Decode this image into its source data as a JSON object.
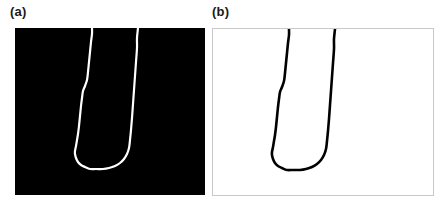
{
  "figure": {
    "caption_present": false,
    "background_color": "#ffffff",
    "width": 444,
    "height": 207
  },
  "panels": [
    {
      "id": "a",
      "label": "(a)",
      "kind": "binary-mask",
      "background_color": "#000000",
      "contour_color": "#ffffff",
      "frame_color": "none",
      "bounds": {
        "x": 15,
        "y": 28,
        "width": 190,
        "height": 167
      },
      "line_width": 2.2
    },
    {
      "id": "b",
      "label": "(b)",
      "kind": "extracted-contour",
      "background_color": "#ffffff",
      "contour_color": "#000000",
      "frame_color": "#c9c9c9",
      "bounds": {
        "x": 212,
        "y": 28,
        "width": 222,
        "height": 168
      },
      "line_width": 2.6
    }
  ],
  "chart_data": {
    "type": "line",
    "title": "",
    "subtitle": "",
    "xlabel": "",
    "ylabel": "",
    "grid": false,
    "legend": null,
    "axis_note": "No axes, tick marks, tick labels or gridlines are drawn in either panel.",
    "series": [
      {
        "name": "contour-panel-a",
        "panel": "a",
        "coordinate_space": "panel-local-pixels",
        "closed": false,
        "points": [
          [
            77,
            0
          ],
          [
            77,
            6
          ],
          [
            76,
            14
          ],
          [
            75,
            24
          ],
          [
            74,
            34
          ],
          [
            73,
            44
          ],
          [
            72,
            52
          ],
          [
            70,
            58
          ],
          [
            68,
            63
          ],
          [
            67,
            70
          ],
          [
            66,
            78
          ],
          [
            65,
            88
          ],
          [
            64,
            98
          ],
          [
            63,
            106
          ],
          [
            62,
            112
          ],
          [
            61,
            118
          ],
          [
            60,
            123
          ],
          [
            60,
            126
          ],
          [
            61,
            130
          ],
          [
            63,
            134
          ],
          [
            66,
            137
          ],
          [
            70,
            139
          ],
          [
            75,
            141
          ],
          [
            81,
            141
          ],
          [
            88,
            141
          ],
          [
            94,
            140
          ],
          [
            100,
            138
          ],
          [
            105,
            135
          ],
          [
            109,
            131
          ],
          [
            112,
            126
          ],
          [
            114,
            120
          ],
          [
            115,
            112
          ],
          [
            116,
            102
          ],
          [
            117,
            90
          ],
          [
            118,
            76
          ],
          [
            119,
            62
          ],
          [
            120,
            48
          ],
          [
            121,
            34
          ],
          [
            122,
            20
          ],
          [
            122,
            10
          ],
          [
            123,
            0
          ]
        ]
      },
      {
        "name": "contour-panel-b",
        "panel": "b",
        "coordinate_space": "panel-local-pixels",
        "closed": false,
        "points": [
          [
            76,
            0
          ],
          [
            76,
            6
          ],
          [
            75,
            14
          ],
          [
            74,
            24
          ],
          [
            73,
            34
          ],
          [
            72,
            44
          ],
          [
            71,
            52
          ],
          [
            69,
            58
          ],
          [
            67,
            63
          ],
          [
            66,
            70
          ],
          [
            65,
            78
          ],
          [
            64,
            88
          ],
          [
            63,
            98
          ],
          [
            62,
            106
          ],
          [
            61,
            112
          ],
          [
            60,
            118
          ],
          [
            59,
            123
          ],
          [
            59,
            126
          ],
          [
            60,
            130
          ],
          [
            62,
            134
          ],
          [
            65,
            137
          ],
          [
            69,
            139
          ],
          [
            74,
            141
          ],
          [
            80,
            141
          ],
          [
            87,
            141
          ],
          [
            93,
            140
          ],
          [
            99,
            138
          ],
          [
            104,
            135
          ],
          [
            108,
            131
          ],
          [
            111,
            126
          ],
          [
            113,
            120
          ],
          [
            114,
            112
          ],
          [
            115,
            102
          ],
          [
            116,
            90
          ],
          [
            117,
            76
          ],
          [
            118,
            62
          ],
          [
            119,
            48
          ],
          [
            120,
            34
          ],
          [
            121,
            20
          ],
          [
            121,
            10
          ],
          [
            122,
            0
          ]
        ]
      }
    ]
  }
}
